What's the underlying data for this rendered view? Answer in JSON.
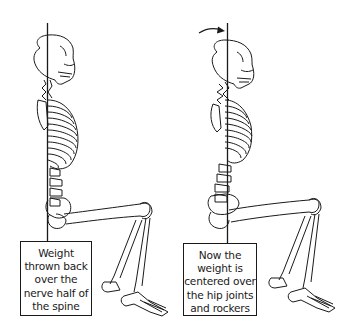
{
  "figures": [
    {
      "id": "left",
      "description": "Seated skeleton with plumb line falling behind the spine",
      "caption_lines": [
        "Weight",
        "thrown back",
        "over the",
        "nerve half of",
        "the spine"
      ],
      "caption": "Weight thrown back over the nerve half of the spine",
      "has_arrow": false
    },
    {
      "id": "right",
      "description": "Seated skeleton with head pulled back so plumb line passes through spine center",
      "caption_lines": [
        "Now the",
        "weight is",
        "centered over",
        "the hip joints",
        "and rockers"
      ],
      "caption": "Now the weight is centered over the hip joints and rockers",
      "has_arrow": true,
      "arrow_icon": "curved-arrow-right"
    }
  ],
  "colors": {
    "line": "#1a1a1a",
    "background": "#ffffff"
  }
}
